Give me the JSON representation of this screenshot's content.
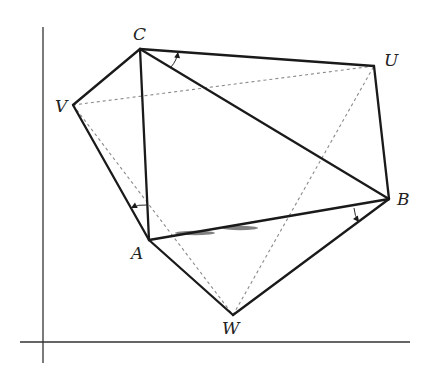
{
  "diagram": {
    "title": "",
    "axes": {
      "vertical": {
        "x": 43,
        "y1": 27,
        "y2": 363
      },
      "horizontal": {
        "y": 342,
        "x1": 20,
        "x2": 410
      }
    },
    "points": {
      "C": {
        "label": "C",
        "x": 140,
        "y": 49,
        "lx": 133,
        "ly": 40
      },
      "U": {
        "label": "U",
        "x": 374,
        "y": 66,
        "lx": 384,
        "ly": 66
      },
      "V": {
        "label": "V",
        "x": 73,
        "y": 105,
        "lx": 55,
        "ly": 112
      },
      "B": {
        "label": "B",
        "x": 389,
        "y": 199,
        "lx": 397,
        "ly": 205
      },
      "A": {
        "label": "A",
        "x": 149,
        "y": 240,
        "lx": 131,
        "ly": 259
      },
      "W": {
        "label": "W",
        "x": 233,
        "y": 315,
        "lx": 222,
        "ly": 334
      }
    },
    "solid_edges": [
      [
        "C",
        "V"
      ],
      [
        "V",
        "A"
      ],
      [
        "A",
        "W"
      ],
      [
        "W",
        "B"
      ],
      [
        "B",
        "U"
      ],
      [
        "U",
        "C"
      ],
      [
        "C",
        "A"
      ],
      [
        "C",
        "B"
      ],
      [
        "A",
        "B"
      ]
    ],
    "dashed_edges": [
      [
        "V",
        "U"
      ],
      [
        "V",
        "W"
      ],
      [
        "W",
        "U"
      ]
    ],
    "rotation_arrows": [
      {
        "name": "arrow-at-C",
        "from": [
          171,
          67
        ],
        "to": [
          178,
          52
        ]
      },
      {
        "name": "arrow-at-A",
        "from": [
          147,
          205
        ],
        "to": [
          131,
          208
        ]
      },
      {
        "name": "arrow-at-B",
        "from": [
          354,
          208
        ],
        "to": [
          359,
          222
        ]
      }
    ],
    "colors": {
      "solid": "#1a1a1a",
      "dashed": "#8a8a8a",
      "axis": "#333333",
      "background": "#ffffff"
    }
  }
}
